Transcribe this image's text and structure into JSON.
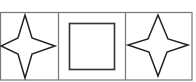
{
  "diagram": {
    "frame": {
      "x": 0,
      "y": 12,
      "width": 192,
      "height": 68,
      "stroke": "#777777"
    },
    "dividers": [
      58,
      125
    ],
    "cells": [
      {
        "shape": "four-point-star",
        "points": "25,15 32,38 55,46 32,54 25,78 18,54 1,46 18,38",
        "stroke": "#222222"
      },
      {
        "shape": "square",
        "x": 69,
        "y": 23,
        "width": 45,
        "height": 46,
        "stroke": "#333333"
      },
      {
        "shape": "four-point-star",
        "points": "158,15 168,39 188,45 167,52 158,76 149,52 128,45 148,39",
        "stroke": "#222222"
      }
    ],
    "colors": {
      "background": "#ffffff",
      "border": "#777777",
      "shape": "#222222"
    }
  }
}
